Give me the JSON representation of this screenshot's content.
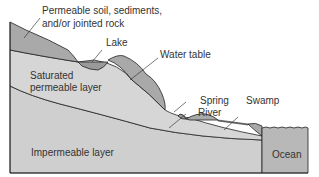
{
  "diagram": {
    "type": "groundwater cross-section",
    "labels": {
      "permeable_soil_line1": "Permeable soil, sediments,",
      "permeable_soil_line2": "and/or jointed rock",
      "lake": "Lake",
      "water_table": "Water table",
      "saturated_line1": "Saturated",
      "saturated_line2": "permeable layer",
      "spring": "Spring",
      "river": "River",
      "swamp": "Swamp",
      "impermeable": "Impermeable layer",
      "ocean": "Ocean"
    },
    "colors": {
      "unsaturated_soil": "#a9a9a9",
      "saturated_layer": "#d4d4d4",
      "impermeable_layer": "#cfcfcf",
      "surface_water": "#9a9a9a",
      "ocean": "#b8b8b8",
      "outline": "#222222"
    }
  }
}
